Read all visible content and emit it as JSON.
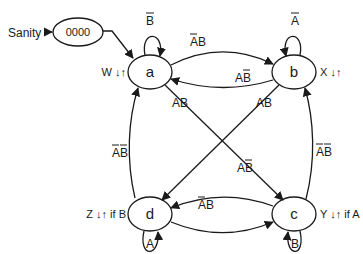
{
  "diagram": {
    "type": "state-machine",
    "input_label": "Sanity",
    "reset_state": {
      "id": "reset",
      "label": "0000"
    },
    "states": [
      {
        "id": "a",
        "label": "a",
        "output": "W ↓↑"
      },
      {
        "id": "b",
        "label": "b",
        "output": "X ↓↑"
      },
      {
        "id": "c",
        "label": "c",
        "output": "Y ↓↑ if A"
      },
      {
        "id": "d",
        "label": "d",
        "output": "Z ↓↑ if B"
      }
    ],
    "transitions": [
      {
        "from": "reset",
        "to": "a",
        "label": ""
      },
      {
        "from": "a",
        "to": "a",
        "label": "B̅",
        "base": "B",
        "overline": "B"
      },
      {
        "from": "a",
        "to": "b",
        "label": "A̅B",
        "base": "AB",
        "overline": "A"
      },
      {
        "from": "b",
        "to": "a",
        "label": "AB̅",
        "base": "AB",
        "overline": "B"
      },
      {
        "from": "b",
        "to": "b",
        "label": "A̅",
        "base": "A",
        "overline": "A"
      },
      {
        "from": "a",
        "to": "c",
        "label": "AB",
        "base": "AB",
        "overline": ""
      },
      {
        "from": "b",
        "to": "d",
        "label": "AB",
        "base": "AB",
        "overline": ""
      },
      {
        "from": "c",
        "to": "b",
        "label": "A̅B̅",
        "base": "AB",
        "overline": "AB"
      },
      {
        "from": "c",
        "to": "c",
        "label": "B",
        "base": "B",
        "overline": ""
      },
      {
        "from": "c",
        "to": "d",
        "label": "AB̅",
        "base": "AB",
        "overline": "B"
      },
      {
        "from": "d",
        "to": "c",
        "label": "A̅B",
        "base": "AB",
        "overline": "A"
      },
      {
        "from": "d",
        "to": "a",
        "label": "A̅B̅",
        "base": "AB",
        "overline": "AB"
      },
      {
        "from": "d",
        "to": "d",
        "label": "A",
        "base": "A",
        "overline": ""
      }
    ]
  },
  "text": {
    "sanity": "Sanity",
    "reset": "0000",
    "a": "a",
    "b": "b",
    "c": "c",
    "d": "d",
    "out_a": "W ↓↑",
    "out_b": "X ↓↑",
    "out_c": "Y ↓↑ if A",
    "out_d": "Z ↓↑ if B",
    "t_aa": "B",
    "t_ab": "AB",
    "t_ba": "AB",
    "t_bb": "A",
    "t_ac": "AB",
    "t_bd": "AB",
    "t_cb": "AB",
    "t_cc": "B",
    "t_cd": "AB",
    "t_dc": "AB",
    "t_da": "AB",
    "t_dd": "A"
  }
}
